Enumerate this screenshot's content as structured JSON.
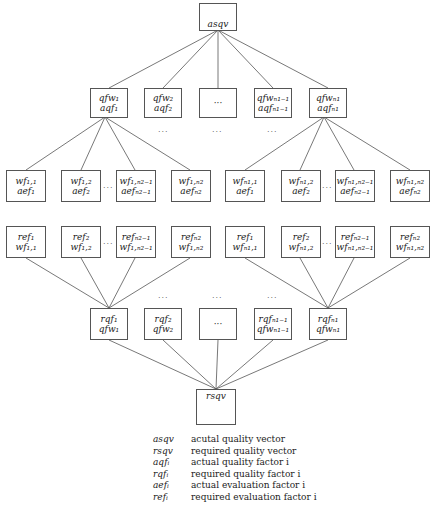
{
  "diagram": {
    "top_node": {
      "label": "asqv"
    },
    "bottom_node": {
      "label": "rsqv"
    },
    "actual_factors": [
      {
        "line1": "qfw₁",
        "line2": "aqf₁"
      },
      {
        "line1": "qfw₂",
        "line2": "aqf₂"
      },
      {
        "line1": "···",
        "line2": ""
      },
      {
        "line1": "qfwₙ₁₋₁",
        "line2": "aqfₙ₁₋₁"
      },
      {
        "line1": "qfwₙ₁",
        "line2": "aqfₙ₁"
      }
    ],
    "actual_evaluations": [
      {
        "line1": "wf₁,₁",
        "line2": "aef₁"
      },
      {
        "line1": "wf₁,₂",
        "line2": "aef₂"
      },
      {
        "line1": "wf₁,ₙ₂₋₁",
        "line2": "aefₙ₂₋₁"
      },
      {
        "line1": "wf₁,ₙ₂",
        "line2": "aefₙ₂"
      },
      {
        "line1": "wfₙ₁,₁",
        "line2": "aef₁"
      },
      {
        "line1": "wfₙ₁,₂",
        "line2": "aef₂"
      },
      {
        "line1": "wfₙ₁,ₙ₂₋₁",
        "line2": "aefₙ₂₋₁"
      },
      {
        "line1": "wfₙ₁,ₙ₂",
        "line2": "aefₙ₂"
      }
    ],
    "required_evaluations": [
      {
        "line1": "ref₁",
        "line2": "wf₁,₁"
      },
      {
        "line1": "ref₂",
        "line2": "wf₁,₂"
      },
      {
        "line1": "refₙ₂₋₁",
        "line2": "wf₁,ₙ₂₋₁"
      },
      {
        "line1": "refₙ₂",
        "line2": "wf₁,ₙ₂"
      },
      {
        "line1": "ref₁",
        "line2": "wfₙ₁,₁"
      },
      {
        "line1": "ref₂",
        "line2": "wfₙ₁,₂"
      },
      {
        "line1": "refₙ₂₋₁",
        "line2": "wfₙ₁,ₙ₂₋₁"
      },
      {
        "line1": "refₙ₂",
        "line2": "wfₙ₁,ₙ₂"
      }
    ],
    "required_factors": [
      {
        "line1": "rqf₁",
        "line2": "qfw₁"
      },
      {
        "line1": "rqf₂",
        "line2": "qfw₂"
      },
      {
        "line1": "···",
        "line2": ""
      },
      {
        "line1": "rqfₙ₁₋₁",
        "line2": "qfwₙ₁₋₁"
      },
      {
        "line1": "rqfₙ₁",
        "line2": "qfwₙ₁"
      }
    ],
    "ellipsis": "···"
  },
  "legend": [
    {
      "symbol": "asqv",
      "description": "acutal quality vector"
    },
    {
      "symbol": "rsqv",
      "description": "required quality vector"
    },
    {
      "symbol": "aqfᵢ",
      "description": "actual quality factor i"
    },
    {
      "symbol": "rqfᵢ",
      "description": "required quality factor i"
    },
    {
      "symbol": "aefᵢ",
      "description": "actual evaluation factor i"
    },
    {
      "symbol": "refᵢ",
      "description": "required evaluation factor i"
    }
  ]
}
